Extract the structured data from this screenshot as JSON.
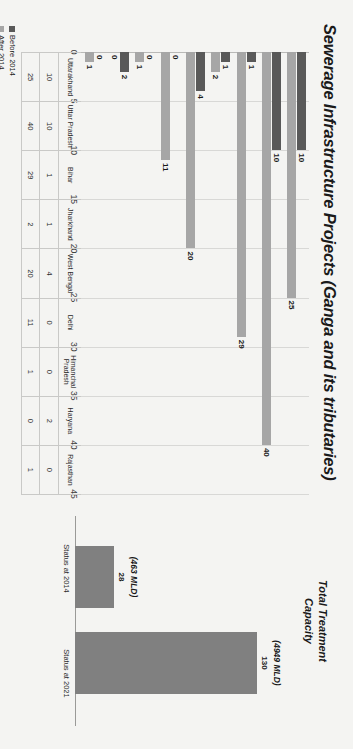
{
  "title": "Sewerage Infrastructure Projects (Ganga and its tributaries)",
  "legend": {
    "before_label": "Before 2014",
    "after_label": "After 2014"
  },
  "colors": {
    "before": "#595959",
    "after": "#a6a6a6",
    "capacity": "#808080",
    "background": "#f4f4f2",
    "grid": "#d8d8d6"
  },
  "capacity_panel": {
    "title_line1": "Total Treatment",
    "title_line2": "Capacity",
    "bars": [
      {
        "axis_label": "Status at 2014",
        "value": 28,
        "value_text": "28",
        "mld_text": "(463 MLD)"
      },
      {
        "axis_label": "Status at 2021",
        "value": 130,
        "value_text": "130",
        "mld_text": "(4949 MLD)"
      }
    ],
    "ymax": 150
  },
  "chart_data": {
    "type": "bar",
    "title": "Sewerage Infrastructure Projects (Ganga and its tributaries)",
    "xlabel": "",
    "ylabel": "",
    "ylim": [
      0,
      45
    ],
    "yticks": [
      "0",
      "5",
      "10",
      "15",
      "20",
      "25",
      "30",
      "35",
      "40",
      "45"
    ],
    "grid": true,
    "legend_position": "bottom-left",
    "orientation": "vertical",
    "categories": [
      "Uttarakhand",
      "Uttar Pradesh",
      "Bihar",
      "Jharkhand",
      "West Bengal",
      "Delhi",
      "Himanchal Pradesh",
      "Haryana",
      "Rajasthan"
    ],
    "series": [
      {
        "name": "Before 2014",
        "values": [
          10,
          10,
          1,
          1,
          4,
          0,
          0,
          2,
          0
        ]
      },
      {
        "name": "After 2014",
        "values": [
          25,
          40,
          29,
          2,
          20,
          11,
          1,
          0,
          1
        ]
      }
    ]
  },
  "table": {
    "row_headers": [
      "Before 2014",
      "After 2014"
    ],
    "columns": [
      "Uttarakhand",
      "Uttar Pradesh",
      "Bihar",
      "Jharkhand",
      "West Bengal",
      "Delhi",
      "Himanchal Pradesh",
      "Haryana",
      "Rajasthan"
    ],
    "rows": [
      [
        "10",
        "10",
        "1",
        "1",
        "4",
        "0",
        "0",
        "2",
        "0"
      ],
      [
        "25",
        "40",
        "29",
        "2",
        "20",
        "11",
        "1",
        "0",
        "1"
      ]
    ]
  }
}
